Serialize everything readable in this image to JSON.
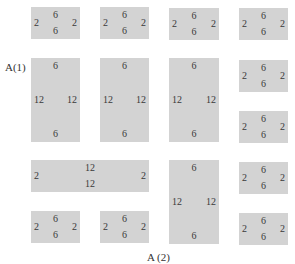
{
  "axis_labels": {
    "vertical": "A(1)",
    "horizontal": "A (2)"
  },
  "block_color": "#d3d3d3",
  "blocks": [
    {
      "id": "b11",
      "top": "6",
      "bottom": "6",
      "left": "2",
      "right": "2"
    },
    {
      "id": "b12",
      "top": "6",
      "bottom": "6",
      "left": "2",
      "right": "2"
    },
    {
      "id": "b13",
      "top": "6",
      "bottom": "6",
      "left": "2",
      "right": "2"
    },
    {
      "id": "b14",
      "top": "6",
      "bottom": "6",
      "left": "2",
      "right": "2"
    },
    {
      "id": "b21",
      "top": "6",
      "bottom": "6",
      "left": "12",
      "right": "12"
    },
    {
      "id": "b22",
      "top": "6",
      "bottom": "6",
      "left": "12",
      "right": "12"
    },
    {
      "id": "b23",
      "top": "6",
      "bottom": "6",
      "left": "12",
      "right": "12"
    },
    {
      "id": "b24",
      "top": "6",
      "bottom": "6",
      "left": "2",
      "right": "2"
    },
    {
      "id": "b34",
      "top": "6",
      "bottom": "6",
      "left": "2",
      "right": "2"
    },
    {
      "id": "bwide",
      "top": "12",
      "bottom": "12",
      "left": "2",
      "right": "2"
    },
    {
      "id": "b43",
      "top": "6",
      "bottom": "6",
      "left": "12",
      "right": "12"
    },
    {
      "id": "b44",
      "top": "6",
      "bottom": "6",
      "left": "2",
      "right": "2"
    },
    {
      "id": "b51",
      "top": "6",
      "bottom": "6",
      "left": "2",
      "right": "2"
    },
    {
      "id": "b52",
      "top": "6",
      "bottom": "6",
      "left": "2",
      "right": "2"
    },
    {
      "id": "b54",
      "top": "6",
      "bottom": "6",
      "left": "2",
      "right": "2"
    }
  ]
}
